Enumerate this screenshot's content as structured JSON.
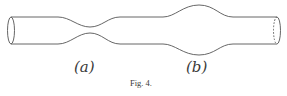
{
  "figure": {
    "caption": "Fig. 4.",
    "labels": {
      "a": "(a)",
      "b": "(b)"
    },
    "stroke_color": "#555555",
    "background": "#ffffff"
  }
}
